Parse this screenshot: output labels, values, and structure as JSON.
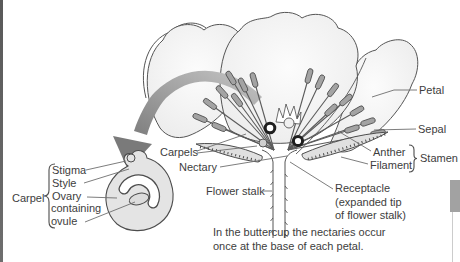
{
  "labels": {
    "petal": "Petal",
    "sepal": "Sepal",
    "anther": "Anther",
    "filament": "Filament",
    "stamen": "Stamen",
    "carpels": "Carpels",
    "nectary": "Nectary",
    "flower_stalk": "Flower stalk",
    "receptacle": [
      "Receptacle",
      "(expanded tip",
      "of flower stalk)"
    ]
  },
  "carpel_detail": {
    "group_label": "Carpel",
    "stigma": "Stigma",
    "style": "Style",
    "ovary_word": "Ovary",
    "containing_word": "containing",
    "ovule_word": "ovule"
  },
  "caption": {
    "line1": "In the buttercup the nectaries occur",
    "line2": "once at the base of each petal."
  },
  "colors": {
    "outline": "#4d4d4d",
    "text": "#3d3d3d",
    "petal_fill": "#f2f2f2",
    "anther_fill": "#a3a3a3",
    "sepal_fill": "#e0e0e0",
    "carpel_fill": "#e4e4e4",
    "arrow_fill": "#9a9a9a",
    "leader_line": "#6e6e6e",
    "page_edge_bar": "#5f5f5f",
    "scrollbar_thumb": "#a2a2a2",
    "scrollbar_track": "#cccccc"
  }
}
